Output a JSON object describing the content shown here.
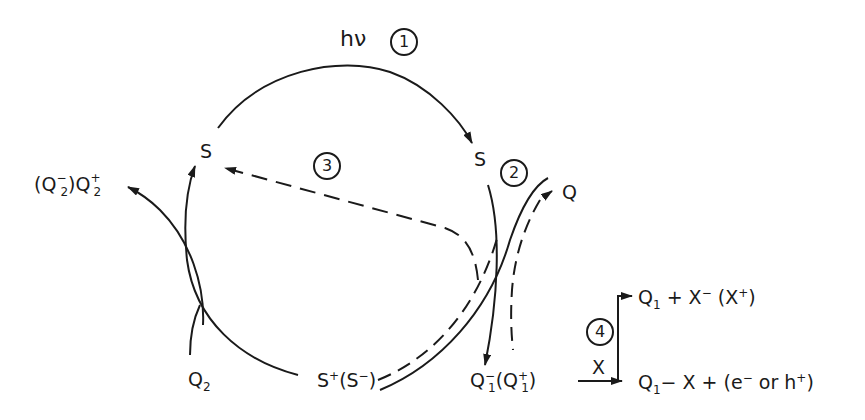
{
  "diagram": {
    "steps": {
      "step1": {
        "number": "1",
        "label": "hν"
      },
      "step2": {
        "number": "2"
      },
      "step3": {
        "number": "3"
      },
      "step4": {
        "number": "4",
        "reagent": "X"
      }
    },
    "nodes": {
      "s_ground": "S",
      "s_excited": "S",
      "s_ion": {
        "main": "S",
        "main_sup": "+",
        "paren": "S",
        "paren_sup": "−"
      },
      "q": "Q",
      "q1_ion": {
        "main": "Q",
        "main_sub": "1",
        "main_sup": "−",
        "paren": "Q",
        "paren_sub": "1",
        "paren_sup": "+"
      },
      "q2": {
        "main": "Q",
        "sub": "2"
      },
      "q2_product": {
        "paren": "Q",
        "paren_sub": "2",
        "paren_sup": "−",
        "main": "Q",
        "main_sub": "2",
        "main_sup": "+"
      },
      "product_top": {
        "q": "Q",
        "q_sub": "1",
        "plus": "+ X",
        "x_sup": "−",
        "paren": "X",
        "paren_sup": "+"
      },
      "product_bottom": {
        "q": "Q",
        "q_sub": "1",
        "rest": "− X + (e",
        "e_sup": "−",
        "or": " or h",
        "h_sup": "+",
        "close": ")"
      }
    },
    "colors": {
      "ink": "#1a1a1a",
      "background": "#ffffff"
    }
  }
}
